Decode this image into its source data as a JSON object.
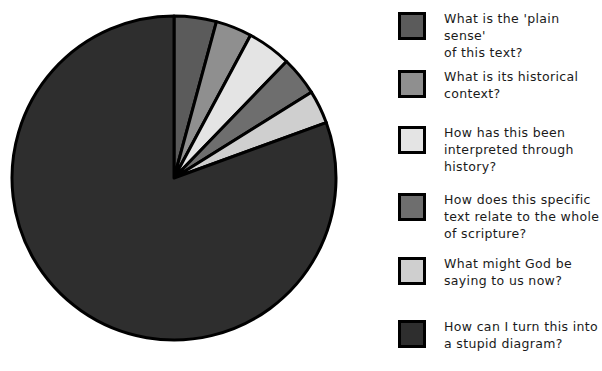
{
  "chart_data": {
    "type": "pie",
    "title": "",
    "legend_position": "right",
    "grid": false,
    "start_angle_deg": 90,
    "direction": "clockwise",
    "categories": [
      "What is the 'plain sense' of this text?",
      "What is its historical context?",
      "How has this been interpreted through history?",
      "How does this specific text relate to the whole of scripture?",
      "What might God be saying to us now?",
      "How can I turn this into a stupid diagram?"
    ],
    "values": [
      4.2,
      3.6,
      4.4,
      3.9,
      3.3,
      80.6
    ],
    "units": "percent",
    "colors": [
      "#5b5b5b",
      "#8f8f8f",
      "#e4e4e4",
      "#6e6e6e",
      "#cfcfcf",
      "#2e2e2e"
    ],
    "edge_color": "#000000",
    "xlabel": "",
    "ylabel": ""
  },
  "legend": {
    "items": [
      {
        "label": "What is the 'plain sense'\nof this text?",
        "color": "#5b5b5b",
        "swatch_name": "legend-swatch-plain-sense"
      },
      {
        "label": "What is its historical\ncontext?",
        "color": "#8f8f8f",
        "swatch_name": "legend-swatch-historical-context"
      },
      {
        "label": "How has this been\ninterpreted through\nhistory?",
        "color": "#e4e4e4",
        "swatch_name": "legend-swatch-interpreted-through-history"
      },
      {
        "label": "How does this specific\ntext relate to the whole\nof scripture?",
        "color": "#6e6e6e",
        "swatch_name": "legend-swatch-relate-to-scripture"
      },
      {
        "label": "What might God be\nsaying to us now?",
        "color": "#cfcfcf",
        "swatch_name": "legend-swatch-god-saying-now"
      },
      {
        "label": "How can I turn this into\na stupid diagram?",
        "color": "#2e2e2e",
        "swatch_name": "legend-swatch-stupid-diagram"
      }
    ]
  },
  "pie": {
    "center_x": 174,
    "center_y": 178,
    "radius": 162,
    "slices": [
      {
        "name": "slice-plain-sense",
        "start": 90,
        "end": 74.8,
        "color": "#5b5b5b"
      },
      {
        "name": "slice-historical-context",
        "start": 74.8,
        "end": 61.8,
        "color": "#8f8f8f"
      },
      {
        "name": "slice-interpreted-through-history",
        "start": 61.8,
        "end": 46.0,
        "color": "#e4e4e4"
      },
      {
        "name": "slice-relate-to-scripture",
        "start": 46.0,
        "end": 32.0,
        "color": "#6e6e6e"
      },
      {
        "name": "slice-god-saying-now",
        "start": 32.0,
        "end": 20.0,
        "color": "#cfcfcf"
      },
      {
        "name": "slice-stupid-diagram",
        "start": 20.0,
        "end": -270.0,
        "color": "#2e2e2e"
      }
    ]
  }
}
